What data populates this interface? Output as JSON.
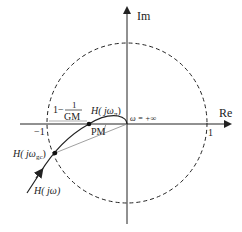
{
  "diagram": {
    "axes": {
      "im_label": "Im",
      "re_label": "Re",
      "tick_neg_one": "−1",
      "tick_pos_one": "1"
    },
    "unit_circle": {
      "style": "dashed"
    },
    "labels": {
      "gm_prefix": "1−",
      "gm_num": "1",
      "gm_den": "GM",
      "h_pi": "H( jω",
      "h_pi_sub": "π",
      "h_pi_close": ")",
      "omega_inf": "ω = +∞",
      "pm": "PM",
      "h_gc": "H( jω",
      "h_gc_sub": "gc",
      "h_gc_close": ")",
      "h_jw": "H( jω)"
    },
    "colors": {
      "stroke": "#222222",
      "guide": "#888888"
    }
  }
}
